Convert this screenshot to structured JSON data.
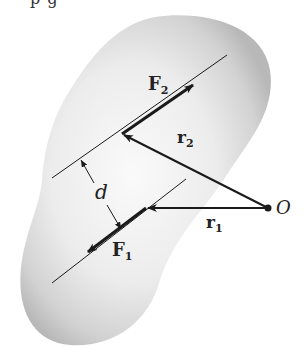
{
  "figure": {
    "top_text_fragment": "p                                        g",
    "labels": {
      "F2": "F",
      "F2_sub": "2",
      "F1": "F",
      "F1_sub": "1",
      "r2": "r",
      "r2_sub": "2",
      "r1": "r",
      "r1_sub": "1",
      "d": "d",
      "O": "O"
    },
    "colors": {
      "body_fill": "#e6e6e6",
      "body_edge": "#bdbdbd",
      "ink": "#1a1a1a"
    }
  }
}
